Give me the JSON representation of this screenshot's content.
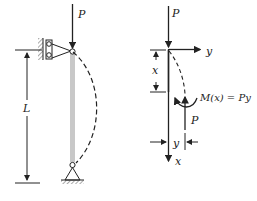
{
  "diagram": {
    "left": {
      "load_label": "P",
      "length_label": "L",
      "description": "Pinned-pinned column of length L under axial load P with buckled (dashed) shape"
    },
    "right": {
      "load_top_label": "P",
      "axis_y_label": "y",
      "axis_x_label": "x",
      "segment_label": "x",
      "moment_label": "M(x) = Py",
      "reaction_label": "P",
      "deflection_label": "y"
    },
    "colors": {
      "line": "#222222",
      "column": "#c8c8c8",
      "background": "#ffffff"
    }
  }
}
